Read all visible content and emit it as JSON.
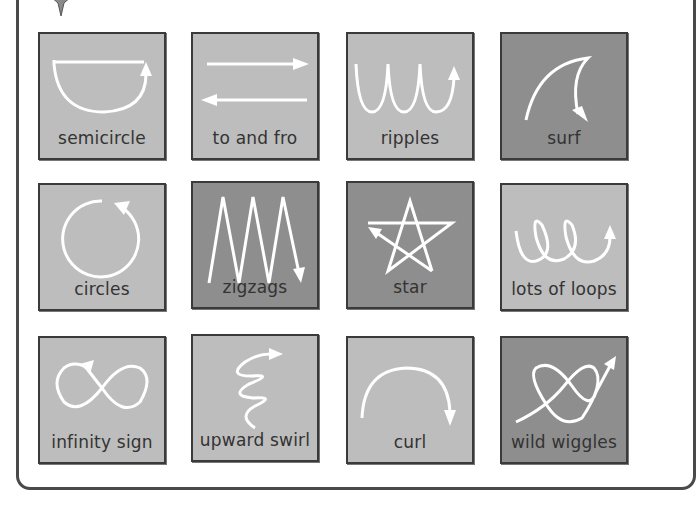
{
  "colors": {
    "light_tile": "#bdbdbd",
    "dark_tile": "#8e8e8e",
    "stroke": "#ffffff",
    "border": "#3a3a3a",
    "text": "#333333"
  },
  "header": {
    "icon": "star-icon"
  },
  "tiles": [
    {
      "label": "semicircle",
      "shade": "light",
      "icon": "semicircle-arrow-icon"
    },
    {
      "label": "to and fro",
      "shade": "light",
      "icon": "to-and-fro-arrows-icon"
    },
    {
      "label": "ripples",
      "shade": "light",
      "icon": "ripples-arrow-icon"
    },
    {
      "label": "surf",
      "shade": "dark",
      "icon": "surf-arrow-icon"
    },
    {
      "label": "circles",
      "shade": "light",
      "icon": "circle-arrow-icon"
    },
    {
      "label": "zigzags",
      "shade": "dark",
      "icon": "zigzag-arrow-icon"
    },
    {
      "label": "star",
      "shade": "dark",
      "icon": "star-arrow-icon"
    },
    {
      "label": "lots of loops",
      "shade": "light",
      "icon": "loops-arrow-icon"
    },
    {
      "label": "infinity sign",
      "shade": "light",
      "icon": "infinity-arrow-icon"
    },
    {
      "label": "upward swirl",
      "shade": "light",
      "icon": "upward-swirl-arrow-icon"
    },
    {
      "label": "curl",
      "shade": "light",
      "icon": "curl-arrow-icon"
    },
    {
      "label": "wild wiggles",
      "shade": "dark",
      "icon": "wild-wiggles-arrow-icon"
    }
  ]
}
